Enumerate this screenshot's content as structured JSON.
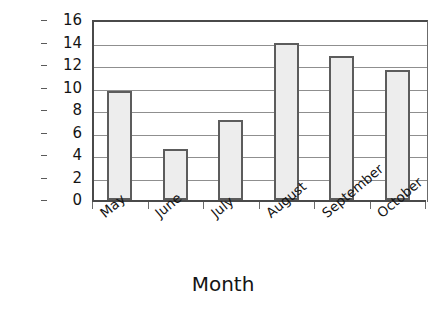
{
  "chart_data": {
    "type": "bar",
    "title": "",
    "xlabel": "Month",
    "ylabel": "Percentage",
    "categories": [
      "May",
      "June",
      "July",
      "August",
      "September",
      "October"
    ],
    "values": [
      9.7,
      4.5,
      7.1,
      14.0,
      12.8,
      11.6
    ],
    "ylim": [
      0,
      16
    ],
    "ytick_labels": [
      "0",
      "2",
      "4",
      "6",
      "8",
      "10",
      "12",
      "14",
      "16"
    ],
    "ytick_values": [
      0,
      2,
      4,
      6,
      8,
      10,
      12,
      14,
      16
    ],
    "grid": "horizontal",
    "legend": "none",
    "bar_fill_color": "#ededed",
    "bar_border_color": "#5c5c5c",
    "axis_color": "#4a4a4a",
    "gridline_color": "#8f8f8f",
    "background_color": "#ffffff",
    "xtick_label_rotation": -40
  }
}
